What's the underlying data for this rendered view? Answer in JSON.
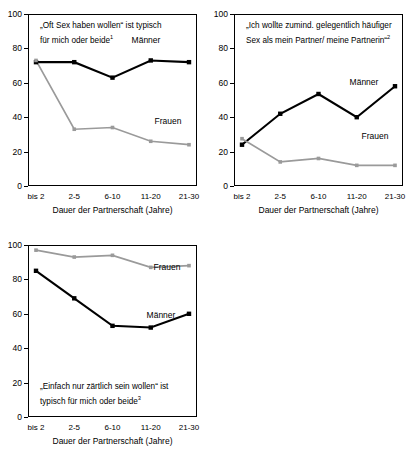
{
  "figure": {
    "panels": [
      {
        "id": "chart-1",
        "title_line1": "„Oft Sex haben wollen“ ist typisch",
        "title_line2": "für mich oder beide",
        "footnote_marker": "1",
        "title_position": "top",
        "label_maenner": "Männer",
        "label_frauen": "Frauen"
      },
      {
        "id": "chart-2",
        "title_line1": "„Ich wollte zumind. gelegentlich häufiger",
        "title_line2": "Sex als mein Partner/ meine Partnerin“",
        "footnote_marker": "2",
        "title_position": "top",
        "label_maenner": "Männer",
        "label_frauen": "Frauen"
      },
      {
        "id": "chart-3",
        "title_line1": "„Einfach nur zärtlich sein wollen“ ist",
        "title_line2": "typisch für mich oder beide",
        "footnote_marker": "3",
        "title_position": "bottom",
        "label_maenner": "Männer",
        "label_frauen": "Frauen"
      }
    ],
    "axis": {
      "xlabel": "Dauer der Partnerschaft (Jahre)",
      "categories": [
        "bis 2",
        "2-5",
        "6-10",
        "11-20",
        "21-30"
      ],
      "yticks": [
        0,
        20,
        40,
        60,
        80,
        100
      ]
    },
    "colors": {
      "maenner": "#000000",
      "frauen": "#9a9a9a",
      "axis": "#000000",
      "background": "#ffffff"
    }
  },
  "chart_data": [
    {
      "type": "line",
      "title": "„Oft Sex haben wollen“ ist typisch für mich oder beide¹",
      "xlabel": "Dauer der Partnerschaft (Jahre)",
      "ylabel": "",
      "categories": [
        "bis 2",
        "2-5",
        "6-10",
        "11-20",
        "21-30"
      ],
      "ylim": [
        0,
        100
      ],
      "yticks": [
        0,
        20,
        40,
        60,
        80,
        100
      ],
      "grid": false,
      "legend": "inline-annotations",
      "series": [
        {
          "name": "Männer",
          "color": "#000000",
          "values": [
            72,
            72,
            63,
            73,
            72
          ]
        },
        {
          "name": "Frauen",
          "color": "#9a9a9a",
          "values": [
            73,
            33,
            34,
            26,
            24
          ]
        }
      ]
    },
    {
      "type": "line",
      "title": "„Ich wollte zumind. gelegentlich häufiger Sex als mein Partner/ meine Partnerin“²",
      "xlabel": "Dauer der Partnerschaft (Jahre)",
      "ylabel": "",
      "categories": [
        "bis 2",
        "2-5",
        "6-10",
        "11-20",
        "21-30"
      ],
      "ylim": [
        0,
        100
      ],
      "yticks": [
        0,
        20,
        40,
        60,
        80,
        100
      ],
      "grid": false,
      "legend": "inline-annotations",
      "series": [
        {
          "name": "Männer",
          "color": "#000000",
          "values": [
            24,
            42,
            53.5,
            40,
            58
          ]
        },
        {
          "name": "Frauen",
          "color": "#9a9a9a",
          "values": [
            27.5,
            14,
            16,
            12,
            12
          ]
        }
      ]
    },
    {
      "type": "line",
      "title": "„Einfach nur zärtlich sein wollen“ ist typisch für mich oder beide³",
      "xlabel": "Dauer der Partnerschaft (Jahre)",
      "ylabel": "",
      "categories": [
        "bis 2",
        "2-5",
        "6-10",
        "11-20",
        "21-30"
      ],
      "ylim": [
        0,
        100
      ],
      "yticks": [
        0,
        20,
        40,
        60,
        80,
        100
      ],
      "grid": false,
      "legend": "inline-annotations",
      "series": [
        {
          "name": "Frauen",
          "color": "#9a9a9a",
          "values": [
            97,
            93,
            94,
            87,
            88
          ]
        },
        {
          "name": "Männer",
          "color": "#000000",
          "values": [
            85,
            69,
            53,
            52,
            60
          ]
        }
      ]
    }
  ]
}
